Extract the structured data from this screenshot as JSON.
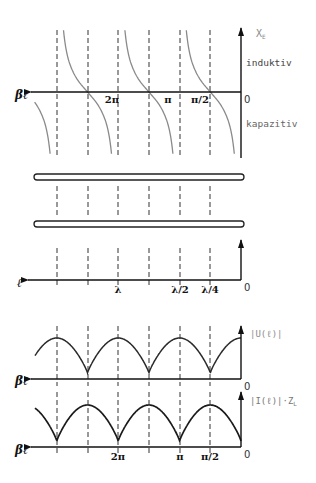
{
  "colors": {
    "axis": "#111111",
    "dash": "#333333",
    "tan_curve": "#8a8a8a",
    "magnitude_curve": "#2a2a2a",
    "label": "#111111",
    "label_gray": "#8c8c8c",
    "wire": "#222222"
  },
  "reactance_plot": {
    "y_axis_label": "X",
    "y_axis_subscript": "E",
    "x_axis_label": "βℓ",
    "origin_label": "0",
    "region_upper": "induktiv",
    "region_lower": "kapazitiv",
    "ticks": [
      {
        "label": "2π",
        "x": 112
      },
      {
        "label": "π",
        "x": 168
      },
      {
        "label": "π/2",
        "x": 200
      }
    ]
  },
  "transmission_line": {
    "conductors": 2,
    "x_axis_label": "ℓ",
    "origin_label": "0",
    "ticks": [
      {
        "label": "λ",
        "x": 118
      },
      {
        "label": "λ/2",
        "x": 180
      },
      {
        "label": "λ/4",
        "x": 210
      }
    ]
  },
  "voltage_plot": {
    "y_axis_label": "|U(ℓ)|",
    "x_axis_label": "βℓ",
    "origin_label": "0"
  },
  "current_plot": {
    "y_axis_label": "|I(ℓ)|·Z",
    "y_axis_subscript": "L",
    "x_axis_label": "βℓ",
    "origin_label": "0",
    "ticks": [
      {
        "label": "2π",
        "x": 118
      },
      {
        "label": "π",
        "x": 180
      },
      {
        "label": "π/2",
        "x": 210
      }
    ]
  },
  "grid": {
    "dashed_lines_x": [
      57,
      88,
      118,
      149,
      180,
      210
    ],
    "origin_x": 241,
    "quarter_wave_px": 30.7
  }
}
